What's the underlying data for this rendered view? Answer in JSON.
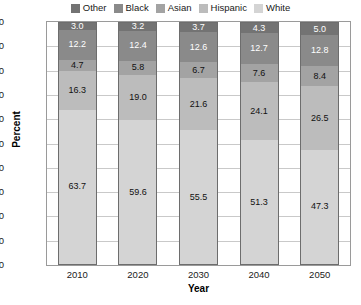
{
  "chart_data": {
    "type": "bar",
    "variant": "stacked-100-percent",
    "title": "",
    "xlabel": "Year",
    "ylabel": "Percent",
    "categories": [
      "2010",
      "2020",
      "2030",
      "2040",
      "2050"
    ],
    "ylim": [
      0,
      100
    ],
    "yticks": [
      "0",
      "10",
      "20",
      "30",
      "40",
      "50",
      "60",
      "70",
      "80",
      "90",
      "100"
    ],
    "grid": "horizontal",
    "legend_position": "top-center",
    "stack_order_top_to_bottom": [
      "Other",
      "Black",
      "Asian",
      "Hispanic",
      "White"
    ],
    "series": [
      {
        "name": "Other",
        "color": "#737373",
        "label_color": "light",
        "values": [
          3.0,
          3.2,
          3.7,
          4.3,
          5.0
        ],
        "labels": [
          "3.0",
          "3.2",
          "3.7",
          "4.3",
          "5.0"
        ]
      },
      {
        "name": "Black",
        "color": "#8a8a8a",
        "label_color": "light",
        "values": [
          12.2,
          12.4,
          12.6,
          12.7,
          12.8
        ],
        "labels": [
          "12.2",
          "12.4",
          "12.6",
          "12.7",
          "12.8"
        ]
      },
      {
        "name": "Asian",
        "color": "#a3a3a3",
        "label_color": "dark",
        "values": [
          4.7,
          5.8,
          6.7,
          7.6,
          8.4
        ],
        "labels": [
          "4.7",
          "5.8",
          "6.7",
          "7.6",
          "8.4"
        ]
      },
      {
        "name": "Hispanic",
        "color": "#bcbcbc",
        "label_color": "dark",
        "values": [
          16.3,
          19.0,
          21.6,
          24.1,
          26.5
        ],
        "labels": [
          "16.3",
          "19.0",
          "21.6",
          "24.1",
          "26.5"
        ]
      },
      {
        "name": "White",
        "color": "#d4d4d4",
        "label_color": "dark",
        "values": [
          63.7,
          59.6,
          55.5,
          51.3,
          47.3
        ],
        "labels": [
          "63.7",
          "59.6",
          "55.5",
          "51.3",
          "47.3"
        ]
      }
    ]
  },
  "legend": {
    "items": [
      {
        "label": "Other",
        "color": "#737373"
      },
      {
        "label": "Black",
        "color": "#8a8a8a"
      },
      {
        "label": "Asian",
        "color": "#a3a3a3"
      },
      {
        "label": "Hispanic",
        "color": "#bcbcbc"
      },
      {
        "label": "White",
        "color": "#d4d4d4"
      }
    ]
  },
  "footnote": {
    "text": ""
  }
}
